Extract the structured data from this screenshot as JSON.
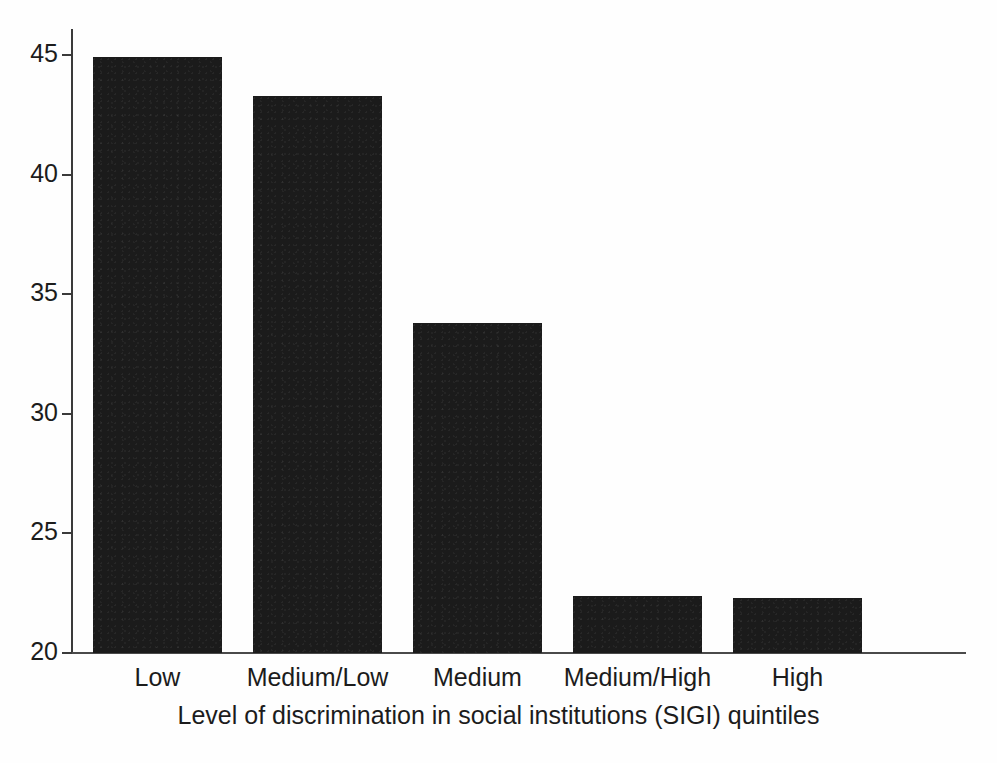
{
  "chart_data": {
    "type": "bar",
    "title": "",
    "subtitle": "",
    "xlabel": "Level of discrimination in social institutions (SIGI) quintiles",
    "ylabel": "",
    "categories": [
      "Low",
      "Medium/Low",
      "Medium",
      "Medium/High",
      "High"
    ],
    "values": [
      44.9,
      43.3,
      33.8,
      22.4,
      22.3
    ],
    "ylim": [
      20,
      45
    ],
    "y_ticks": [
      20,
      25,
      30,
      35,
      40,
      45
    ],
    "y_tick_labels": [
      "20",
      "25",
      "30",
      "35",
      "40",
      "45"
    ],
    "grid": false,
    "legend": null,
    "legend_position": "none",
    "bar_color": "#1b1b1b",
    "axis_color": "#3a3a3a",
    "background_color": "#ffffff",
    "annotations": []
  },
  "axes": {
    "x_axis_title": "Level of discrimination in social institutions (SIGI) quintiles",
    "y_axis_title": ""
  },
  "caption": {
    "text": ""
  }
}
